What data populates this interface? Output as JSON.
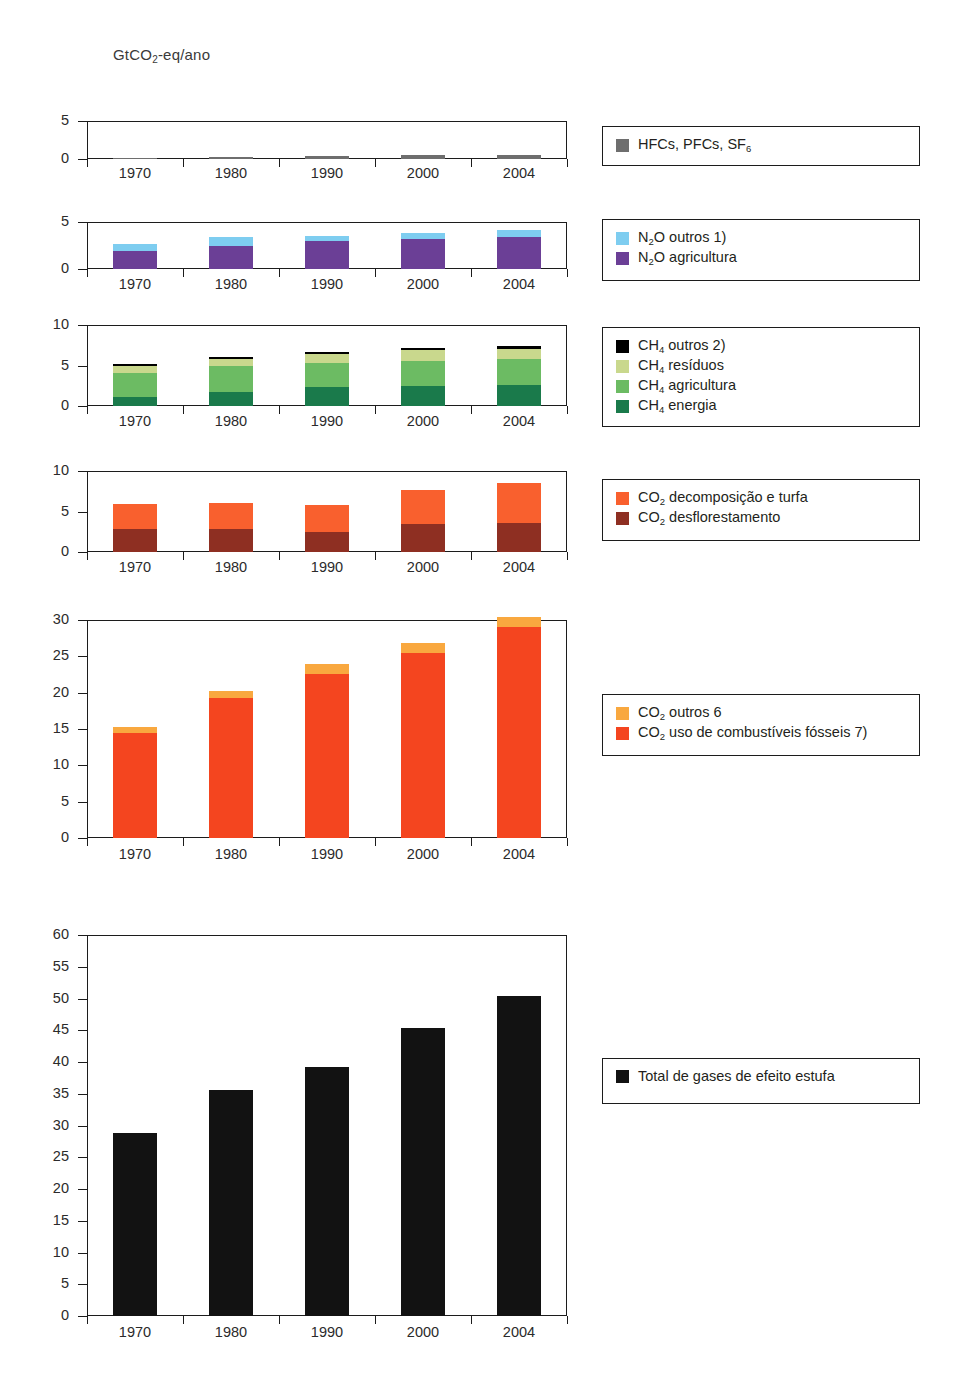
{
  "unit_label": {
    "prefix": "GtCO",
    "sub": "2",
    "suffix": "-eq/ano"
  },
  "categories": [
    "1970",
    "1980",
    "1990",
    "2000",
    "2004"
  ],
  "colors": {
    "hfc_pfc_sf6": "#6e6e6e",
    "n2o_outros": "#7ecdf0",
    "n2o_agricultura": "#6b3f96",
    "ch4_outros": "#000000",
    "ch4_residuos": "#c9d88d",
    "ch4_agricultura": "#6cbb63",
    "ch4_energia": "#1a7a4b",
    "co2_decomposicao": "#f9602e",
    "co2_desflorestamento": "#8e2f22",
    "co2_outros": "#f9a83f",
    "co2_fosseis": "#f4451f",
    "total": "#121212"
  },
  "panels": [
    {
      "id": "panel-hfc",
      "ylim": [
        0,
        5
      ],
      "yticks": [
        "0",
        "5"
      ],
      "legend": [
        {
          "key": "hfc_pfc_sf6",
          "prefix": "HFCs, PFCs, SF",
          "sub": "6",
          "suffix": ""
        }
      ],
      "series": [
        {
          "name": "HFCs, PFCs, SF6",
          "key": "hfc_pfc_sf6",
          "values": [
            0.1,
            0.25,
            0.35,
            0.5,
            0.5
          ]
        }
      ]
    },
    {
      "id": "panel-n2o",
      "ylim": [
        0,
        5
      ],
      "yticks": [
        "0",
        "5"
      ],
      "legend": [
        {
          "key": "n2o_outros",
          "prefix": "N",
          "sub": "2",
          "suffix": "O outros 1)"
        },
        {
          "key": "n2o_agricultura",
          "prefix": "N",
          "sub": "2",
          "suffix": "O agricultura"
        }
      ],
      "series": [
        {
          "name": "N2O agricultura",
          "key": "n2o_agricultura",
          "values": [
            1.9,
            2.5,
            3.0,
            3.2,
            3.4
          ]
        },
        {
          "name": "N2O outros",
          "key": "n2o_outros",
          "values": [
            0.8,
            0.9,
            0.5,
            0.6,
            0.7
          ]
        }
      ]
    },
    {
      "id": "panel-ch4",
      "ylim": [
        0,
        10
      ],
      "yticks": [
        "0",
        "5",
        "10"
      ],
      "legend": [
        {
          "key": "ch4_outros",
          "prefix": "CH",
          "sub": "4",
          "suffix": " outros 2)"
        },
        {
          "key": "ch4_residuos",
          "prefix": "CH",
          "sub": "4",
          "suffix": " resíduos"
        },
        {
          "key": "ch4_agricultura",
          "prefix": "CH",
          "sub": "4",
          "suffix": " agricultura"
        },
        {
          "key": "ch4_energia",
          "prefix": "CH",
          "sub": "4",
          "suffix": " energia"
        }
      ],
      "series": [
        {
          "name": "CH4 energia",
          "key": "ch4_energia",
          "values": [
            1.1,
            1.7,
            2.3,
            2.5,
            2.6
          ]
        },
        {
          "name": "CH4 agricultura",
          "key": "ch4_agricultura",
          "values": [
            3.0,
            3.2,
            3.0,
            3.1,
            3.2
          ]
        },
        {
          "name": "CH4 resíduos",
          "key": "ch4_residuos",
          "values": [
            0.9,
            0.9,
            1.1,
            1.3,
            1.3
          ]
        },
        {
          "name": "CH4 outros",
          "key": "ch4_outros",
          "values": [
            0.2,
            0.3,
            0.3,
            0.3,
            0.3
          ]
        }
      ]
    },
    {
      "id": "panel-co2-land",
      "ylim": [
        0,
        10
      ],
      "yticks": [
        "0",
        "5",
        "10"
      ],
      "legend": [
        {
          "key": "co2_decomposicao",
          "prefix": "CO",
          "sub": "2",
          "suffix": " decomposição e turfa"
        },
        {
          "key": "co2_desflorestamento",
          "prefix": "CO",
          "sub": "2",
          "suffix": " desflorestamento"
        }
      ],
      "series": [
        {
          "name": "CO2 desflorestamento",
          "key": "co2_desflorestamento",
          "values": [
            2.8,
            2.85,
            2.5,
            3.4,
            3.6
          ]
        },
        {
          "name": "CO2 decomposição e turfa",
          "key": "co2_decomposicao",
          "values": [
            3.1,
            3.15,
            3.3,
            4.3,
            4.9
          ]
        }
      ]
    },
    {
      "id": "panel-co2-fossil",
      "ylim": [
        0,
        30
      ],
      "yticks": [
        "0",
        "5",
        "10",
        "15",
        "20",
        "25",
        "30"
      ],
      "legend": [
        {
          "key": "co2_outros",
          "prefix": "CO",
          "sub": "2",
          "suffix": " outros 6"
        },
        {
          "key": "co2_fosseis",
          "prefix": "CO",
          "sub": "2",
          "suffix": " uso de combustíveis fósseis 7)"
        }
      ],
      "series": [
        {
          "name": "CO2 uso de combustíveis fósseis",
          "key": "co2_fosseis",
          "values": [
            14.4,
            19.2,
            22.6,
            25.5,
            29.1
          ]
        },
        {
          "name": "CO2 outros",
          "key": "co2_outros",
          "values": [
            0.9,
            1.1,
            1.3,
            1.3,
            1.3
          ]
        }
      ]
    },
    {
      "id": "panel-total",
      "ylim": [
        0,
        60
      ],
      "yticks": [
        "0",
        "5",
        "10",
        "15",
        "20",
        "25",
        "30",
        "35",
        "40",
        "45",
        "50",
        "55",
        "60"
      ],
      "legend": [
        {
          "key": "total",
          "prefix": "Total de gases de efeito estufa",
          "sub": "",
          "suffix": ""
        }
      ],
      "series": [
        {
          "name": "Total de gases de efeito estufa",
          "key": "total",
          "values": [
            28.9,
            35.6,
            39.2,
            45.4,
            50.4
          ]
        }
      ]
    }
  ],
  "chart_data": {
    "type": "bar",
    "title": "",
    "subtitle": "",
    "xlabel": "",
    "ylabel": "GtCO2-eq/ano",
    "grid": false,
    "legend_position": "right",
    "categories": [
      "1970",
      "1980",
      "1990",
      "2000",
      "2004"
    ],
    "panels": [
      {
        "name": "HFCs, PFCs, SF6",
        "ylim": [
          0,
          5
        ],
        "yticks": [
          0,
          5
        ],
        "stacked": true,
        "series": [
          {
            "name": "HFCs, PFCs, SF6",
            "color": "#6e6e6e",
            "values": [
              0.1,
              0.25,
              0.35,
              0.5,
              0.5
            ]
          }
        ]
      },
      {
        "name": "N2O",
        "ylim": [
          0,
          5
        ],
        "yticks": [
          0,
          5
        ],
        "stacked": true,
        "series": [
          {
            "name": "N2O agricultura",
            "color": "#6b3f96",
            "values": [
              1.9,
              2.5,
              3.0,
              3.2,
              3.4
            ]
          },
          {
            "name": "N2O outros 1)",
            "color": "#7ecdf0",
            "values": [
              0.8,
              0.9,
              0.5,
              0.6,
              0.7
            ]
          }
        ],
        "totals": [
          2.7,
          3.4,
          3.5,
          3.8,
          4.1
        ]
      },
      {
        "name": "CH4",
        "ylim": [
          0,
          10
        ],
        "yticks": [
          0,
          5,
          10
        ],
        "stacked": true,
        "series": [
          {
            "name": "CH4 energia",
            "color": "#1a7a4b",
            "values": [
              1.1,
              1.7,
              2.3,
              2.5,
              2.6
            ]
          },
          {
            "name": "CH4 agricultura",
            "color": "#6cbb63",
            "values": [
              3.0,
              3.2,
              3.0,
              3.1,
              3.2
            ]
          },
          {
            "name": "CH4 resíduos",
            "color": "#c9d88d",
            "values": [
              0.9,
              0.9,
              1.1,
              1.3,
              1.3
            ]
          },
          {
            "name": "CH4 outros 2)",
            "color": "#000000",
            "values": [
              0.2,
              0.3,
              0.3,
              0.3,
              0.3
            ]
          }
        ],
        "totals": [
          5.2,
          6.1,
          6.7,
          7.2,
          7.4
        ]
      },
      {
        "name": "CO2 uso do solo",
        "ylim": [
          0,
          10
        ],
        "yticks": [
          0,
          5,
          10
        ],
        "stacked": true,
        "series": [
          {
            "name": "CO2 desflorestamento",
            "color": "#8e2f22",
            "values": [
              2.8,
              2.85,
              2.5,
              3.4,
              3.6
            ]
          },
          {
            "name": "CO2 decomposição e turfa",
            "color": "#f9602e",
            "values": [
              3.1,
              3.15,
              3.3,
              4.3,
              4.9
            ]
          }
        ],
        "totals": [
          5.9,
          6.0,
          5.8,
          7.7,
          8.5
        ]
      },
      {
        "name": "CO2 fósseis",
        "ylim": [
          0,
          30
        ],
        "yticks": [
          0,
          5,
          10,
          15,
          20,
          25,
          30
        ],
        "stacked": true,
        "series": [
          {
            "name": "CO2 uso de combustíveis fósseis 7)",
            "color": "#f4451f",
            "values": [
              14.4,
              19.2,
              22.6,
              25.5,
              29.1
            ]
          },
          {
            "name": "CO2 outros 6",
            "color": "#f9a83f",
            "values": [
              0.9,
              1.1,
              1.3,
              1.3,
              1.3
            ]
          }
        ],
        "totals": [
          15.3,
          20.3,
          23.9,
          26.8,
          30.4
        ]
      },
      {
        "name": "Total",
        "ylim": [
          0,
          60
        ],
        "yticks": [
          0,
          5,
          10,
          15,
          20,
          25,
          30,
          35,
          40,
          45,
          50,
          55,
          60
        ],
        "stacked": false,
        "series": [
          {
            "name": "Total de gases de efeito estufa",
            "color": "#121212",
            "values": [
              28.9,
              35.6,
              39.2,
              45.4,
              50.4
            ]
          }
        ]
      }
    ]
  }
}
